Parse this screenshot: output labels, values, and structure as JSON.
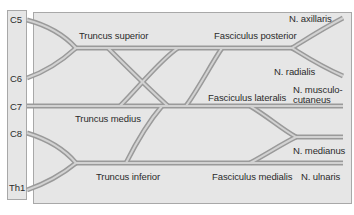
{
  "diagram": {
    "roots": [
      {
        "label": "C5",
        "y": 20
      },
      {
        "label": "C6",
        "y": 80
      },
      {
        "label": "C7",
        "y": 106
      },
      {
        "label": "C8",
        "y": 132
      },
      {
        "label": "Th1",
        "y": 190
      }
    ],
    "trunks": {
      "superior": "Truncus superior",
      "medius": "Truncus medius",
      "inferior": "Truncus inferior"
    },
    "cords": {
      "posterior": "Fasciculus posterior",
      "lateralis": "Fasciculus lateralis",
      "medialis": "Fasciculus medialis"
    },
    "nerves": {
      "axillaris": "N. axillaris",
      "radialis": "N. radialis",
      "musculocutaneus_line1": "N. musculo-",
      "musculocutaneus_line2": "cutaneus",
      "medianus": "N. medianus",
      "ulnaris": "N. ulnaris"
    },
    "colors": {
      "background": "#ffffff",
      "panel_fill": "#e6e6e6",
      "panel_border": "#a8a8a8",
      "nerve_outer": "#9a9a9a",
      "nerve_inner": "#d2d2d2",
      "text": "#2b2b2b"
    }
  }
}
